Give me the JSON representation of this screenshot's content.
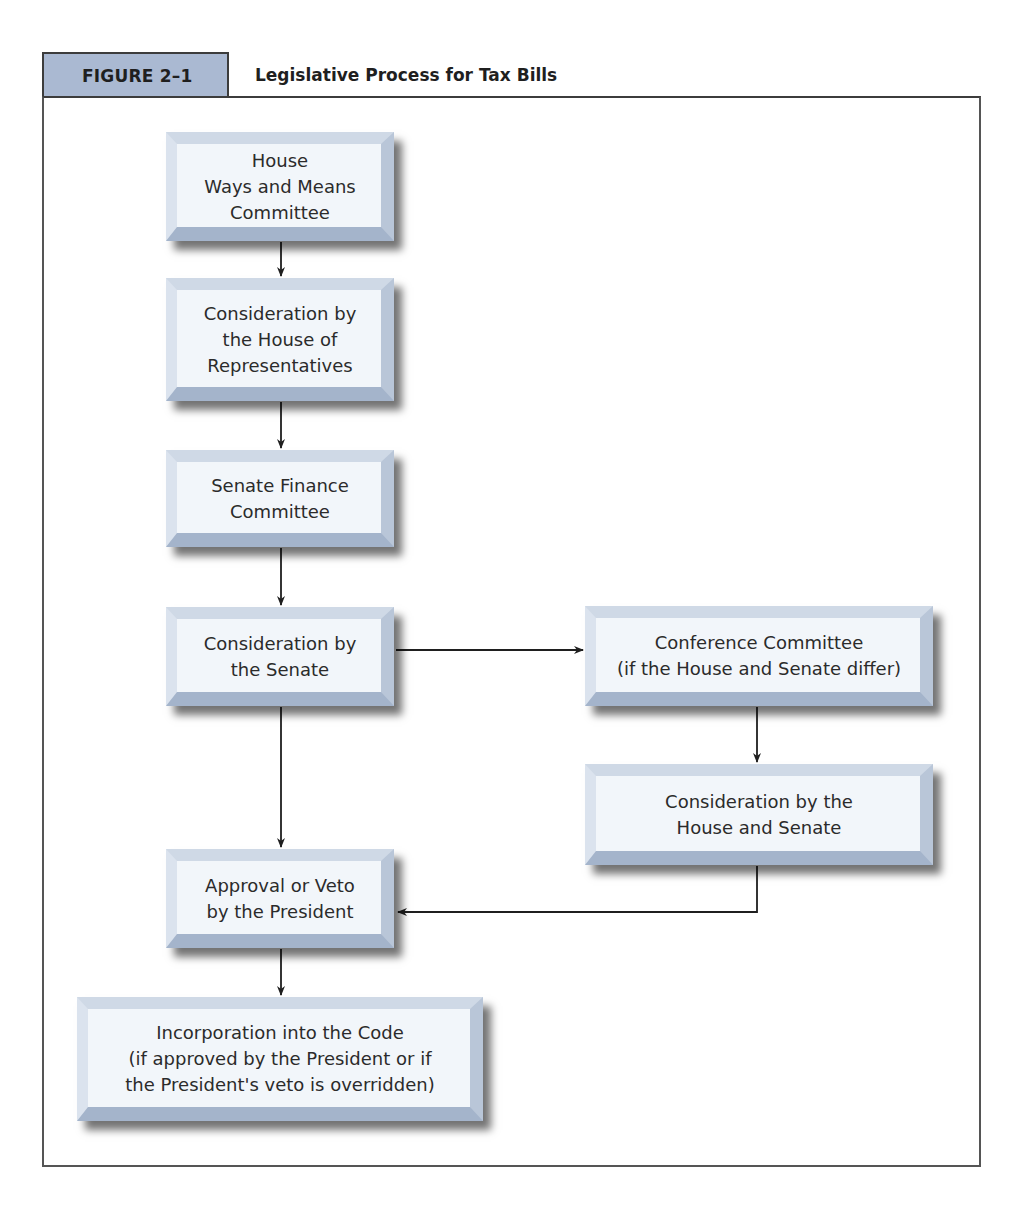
{
  "figure": {
    "number": "FIGURE 2–1",
    "title": "Legislative Process for Tax Bills"
  },
  "colors": {
    "tab_fill": "#aab9d2",
    "box_face": "#f2f6fa",
    "bevel_light": "#cfd9e6",
    "bevel_dark": "#a4b4cb",
    "arrow": "#1f1f1f",
    "frame": "#555555"
  },
  "nodes": [
    {
      "id": "ways-and-means",
      "label": "House\nWays and Means\nCommittee"
    },
    {
      "id": "house-consideration",
      "label": "Consideration by\nthe House of\nRepresentatives"
    },
    {
      "id": "senate-finance",
      "label": "Senate Finance\nCommittee"
    },
    {
      "id": "senate-consideration",
      "label": "Consideration by\nthe Senate"
    },
    {
      "id": "conference-committee",
      "label": "Conference Committee\n(if the House and Senate differ)"
    },
    {
      "id": "house-senate-consideration",
      "label": "Consideration by the\nHouse and Senate"
    },
    {
      "id": "president",
      "label": "Approval or Veto\nby the President"
    },
    {
      "id": "code-incorporation",
      "label": "Incorporation into the Code\n(if approved by the President or if\nthe President's veto is overridden)"
    }
  ],
  "edges": [
    {
      "from": "ways-and-means",
      "to": "house-consideration"
    },
    {
      "from": "house-consideration",
      "to": "senate-finance"
    },
    {
      "from": "senate-finance",
      "to": "senate-consideration"
    },
    {
      "from": "senate-consideration",
      "to": "conference-committee"
    },
    {
      "from": "senate-consideration",
      "to": "president"
    },
    {
      "from": "conference-committee",
      "to": "house-senate-consideration"
    },
    {
      "from": "house-senate-consideration",
      "to": "president"
    },
    {
      "from": "president",
      "to": "code-incorporation"
    }
  ]
}
